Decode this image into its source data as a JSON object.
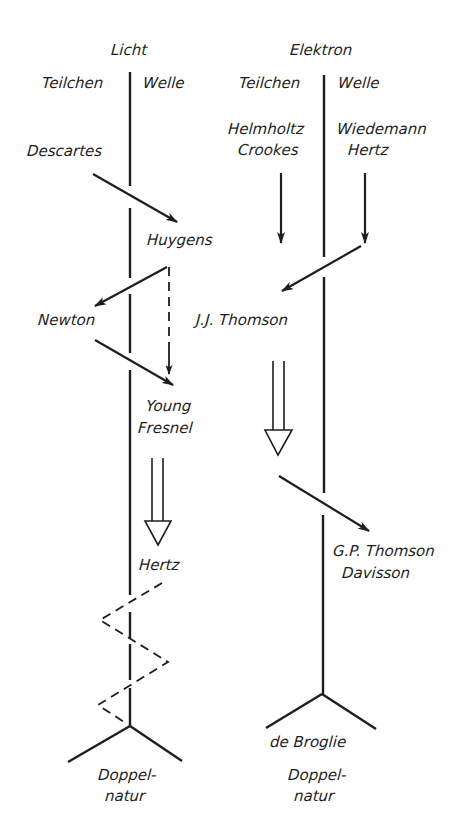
{
  "diagram": {
    "left_column": {
      "title": "Licht",
      "side_particle": "Teilchen",
      "side_wave": "Welle",
      "nodes": {
        "descartes": "Descartes",
        "huygens": "Huygens",
        "newton": "Newton",
        "young": "Young",
        "fresnel": "Fresnel",
        "hertz": "Hertz"
      },
      "result_line1": "Doppel-",
      "result_line2": "natur"
    },
    "right_column": {
      "title": "Elektron",
      "side_particle": "Teilchen",
      "side_wave": "Welle",
      "nodes": {
        "helmholtz": "Helmholtz",
        "crookes": "Crookes",
        "wiedemann": "Wiedemann",
        "hertz": "Hertz",
        "jj_thomson": "J.J. Thomson",
        "gp_thomson": "G.P. Thomson",
        "davisson": "Davisson"
      },
      "synthesizer": "de Broglie",
      "result_line1": "Doppel-",
      "result_line2": "natur"
    },
    "edges": [
      {
        "from": "Descartes",
        "to": "Huygens",
        "style": "solid-arrow"
      },
      {
        "from": "Huygens",
        "to": "Newton",
        "style": "solid-arrow"
      },
      {
        "from": "Huygens",
        "to": "Young/Fresnel",
        "style": "dashed-arrow"
      },
      {
        "from": "Newton",
        "to": "Young/Fresnel",
        "style": "solid-arrow"
      },
      {
        "from": "Young/Fresnel",
        "to": "Hertz",
        "style": "hollow-double-arrow"
      },
      {
        "from": "Hertz",
        "to": "Doppelnatur (Licht)",
        "style": "dashed-zigzag"
      },
      {
        "from": "Helmholtz/Crookes",
        "to": "J.J. Thomson",
        "style": "solid-arrow"
      },
      {
        "from": "Wiedemann/Hertz",
        "to": "J.J. Thomson",
        "style": "solid-arrow"
      },
      {
        "from": "J.J. Thomson",
        "to": "G.P. Thomson/Davisson",
        "style": "hollow-double-arrow"
      },
      {
        "from": "de Broglie",
        "to": "Doppelnatur (Elektron)",
        "style": "fork"
      }
    ]
  }
}
